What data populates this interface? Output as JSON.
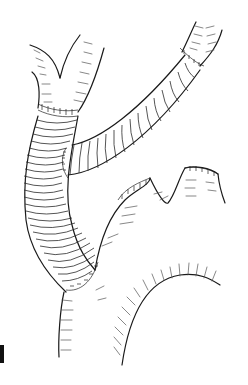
{
  "figure": {
    "colors": {
      "ink": "#1a1a1a",
      "background": "#ffffff"
    },
    "elements": [
      "upper-bifurcating-vessel",
      "main-graft-limb",
      "side-graft-limb",
      "upper-right-vessel-stump",
      "lower-aorta-segment",
      "side-branch-stumps",
      "panel-mark"
    ]
  }
}
